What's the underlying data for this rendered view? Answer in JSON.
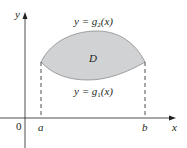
{
  "diagram": {
    "type": "region-between-curves",
    "axes": {
      "x_label": "x",
      "y_label": "y",
      "origin_label": "0"
    },
    "x_ticks": [
      {
        "label": "a"
      },
      {
        "label": "b"
      }
    ],
    "region": {
      "label": "D",
      "fill_color": "#d1d2d4",
      "stroke_color": "#6d6e71"
    },
    "curves": {
      "upper": {
        "prefix": "y = ",
        "func": "g",
        "sub": "2",
        "arg": "(x)"
      },
      "lower": {
        "prefix": "y = ",
        "func": "g",
        "sub": "1",
        "arg": "(x)"
      }
    },
    "colors": {
      "axis": "#231f20",
      "dashed": "#231f20"
    }
  }
}
